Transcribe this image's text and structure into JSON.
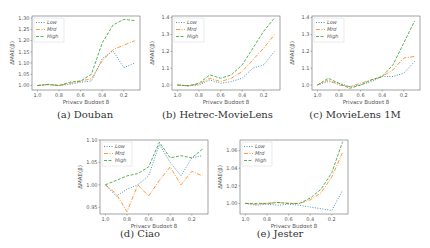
{
  "chart_data": [
    {
      "id": "a",
      "type": "line",
      "caption": "(a) Douban",
      "xlabel": "Privacy Budget β",
      "ylabel": "ΔMAE(β)",
      "x": [
        1.0,
        0.9,
        0.8,
        0.7,
        0.6,
        0.5,
        0.4,
        0.3,
        0.2,
        0.1
      ],
      "xticks": [
        "1.0",
        "0.8",
        "0.6",
        "0.4",
        "0.2"
      ],
      "xlim": [
        1.05,
        0.05
      ],
      "yticks": [
        "1.00",
        "1.05",
        "1.10",
        "1.15",
        "1.20",
        "1.25",
        "1.30"
      ],
      "ylim": [
        0.98,
        1.31
      ],
      "grid": false,
      "legend_position": "upper left",
      "series": [
        {
          "name": "Low",
          "style": "dotted",
          "values": [
            1.0,
            1.003,
            1.0,
            1.005,
            1.015,
            1.02,
            1.12,
            1.155,
            1.08,
            1.1
          ]
        },
        {
          "name": "Mrd",
          "style": "dashdot",
          "values": [
            1.0,
            1.005,
            1.0,
            1.01,
            1.02,
            1.03,
            1.11,
            1.16,
            1.18,
            1.2
          ]
        },
        {
          "name": "High",
          "style": "dashed",
          "values": [
            1.0,
            1.005,
            1.0,
            1.015,
            1.02,
            1.05,
            1.19,
            1.27,
            1.295,
            1.29
          ]
        }
      ]
    },
    {
      "id": "b",
      "type": "line",
      "caption": "(b) Hetrec-MovieLens",
      "xlabel": "Privacy Budget β",
      "ylabel": "ΔMAE(β)",
      "x": [
        1.0,
        0.9,
        0.8,
        0.7,
        0.6,
        0.5,
        0.4,
        0.3,
        0.2,
        0.1
      ],
      "xticks": [
        "1.0",
        "0.8",
        "0.6",
        "0.4",
        "0.2"
      ],
      "xlim": [
        1.05,
        0.05
      ],
      "yticks": [
        "1.0",
        "1.1",
        "1.2",
        "1.3",
        "1.4"
      ],
      "ylim": [
        0.97,
        1.41
      ],
      "grid": false,
      "legend_position": "upper left",
      "series": [
        {
          "name": "Low",
          "style": "dotted",
          "values": [
            1.0,
            0.995,
            1.0,
            1.03,
            1.01,
            1.02,
            1.04,
            1.1,
            1.12,
            1.2
          ]
        },
        {
          "name": "Mrd",
          "style": "dashdot",
          "values": [
            1.0,
            0.995,
            1.005,
            1.04,
            1.02,
            1.04,
            1.08,
            1.15,
            1.22,
            1.3
          ]
        },
        {
          "name": "High",
          "style": "dashed",
          "values": [
            1.0,
            0.995,
            1.01,
            1.06,
            1.04,
            1.06,
            1.12,
            1.22,
            1.32,
            1.4
          ]
        }
      ]
    },
    {
      "id": "c",
      "type": "line",
      "caption": "(c) MovieLens 1M",
      "xlabel": "Privacy Budget β",
      "ylabel": "ΔMAE(β)",
      "x": [
        1.0,
        0.9,
        0.8,
        0.7,
        0.6,
        0.5,
        0.4,
        0.3,
        0.2,
        0.1
      ],
      "xticks": [
        "1.0",
        "0.8",
        "0.6",
        "0.4",
        "0.2"
      ],
      "xlim": [
        1.05,
        0.05
      ],
      "yticks": [
        "1.0",
        "1.1",
        "1.2",
        "1.3",
        "1.4"
      ],
      "ylim": [
        0.97,
        1.41
      ],
      "grid": false,
      "legend_position": "upper left",
      "series": [
        {
          "name": "Low",
          "style": "dotted",
          "values": [
            1.0,
            1.02,
            1.01,
            0.99,
            1.0,
            1.02,
            1.05,
            1.05,
            1.07,
            1.14
          ]
        },
        {
          "name": "Mrd",
          "style": "dashdot",
          "values": [
            1.0,
            1.03,
            1.0,
            0.99,
            1.01,
            1.03,
            1.05,
            1.09,
            1.16,
            1.17
          ]
        },
        {
          "name": "High",
          "style": "dashed",
          "values": [
            1.0,
            1.04,
            1.01,
            0.98,
            1.0,
            1.03,
            1.05,
            1.12,
            1.25,
            1.38
          ]
        }
      ]
    },
    {
      "id": "d",
      "type": "line",
      "caption": "(d) Ciao",
      "xlabel": "Privacy Budget β",
      "ylabel": "ΔMAE(β)",
      "x": [
        1.0,
        0.9,
        0.8,
        0.7,
        0.6,
        0.5,
        0.4,
        0.3,
        0.2,
        0.1
      ],
      "xticks": [
        "1.0",
        "0.8",
        "0.6",
        "0.4",
        "0.2"
      ],
      "xlim": [
        1.05,
        0.05
      ],
      "yticks": [
        "0.95",
        "1.00",
        "1.05",
        "1.10"
      ],
      "ylim": [
        0.935,
        1.1
      ],
      "grid": false,
      "legend_position": "upper left",
      "series": [
        {
          "name": "Low",
          "style": "dotted",
          "values": [
            1.0,
            0.975,
            0.99,
            1.0,
            1.02,
            1.09,
            1.05,
            1.02,
            1.06,
            1.065
          ]
        },
        {
          "name": "Mrd",
          "style": "dashdot",
          "values": [
            1.0,
            0.98,
            0.94,
            1.0,
            0.975,
            1.01,
            1.04,
            1.0,
            1.03,
            1.02
          ]
        },
        {
          "name": "High",
          "style": "dashed",
          "values": [
            1.0,
            1.01,
            1.02,
            1.025,
            1.04,
            1.095,
            1.06,
            1.065,
            1.06,
            1.08
          ]
        }
      ]
    },
    {
      "id": "e",
      "type": "line",
      "caption": "(e) Jester",
      "xlabel": "Privacy Budget β",
      "ylabel": "ΔMAE(β)",
      "x": [
        1.0,
        0.9,
        0.8,
        0.7,
        0.6,
        0.5,
        0.4,
        0.3,
        0.2,
        0.1
      ],
      "xticks": [
        "1.0",
        "0.8",
        "0.6",
        "0.4",
        "0.2"
      ],
      "xlim": [
        1.05,
        0.05
      ],
      "yticks": [
        "1.00",
        "1.02",
        "1.04",
        "1.06"
      ],
      "ylim": [
        0.988,
        1.072
      ],
      "grid": false,
      "legend_position": "upper left",
      "series": [
        {
          "name": "Low",
          "style": "dotted",
          "values": [
            1.0,
            0.998,
            0.999,
            0.998,
            0.999,
            0.998,
            0.996,
            0.994,
            0.992,
            1.015
          ]
        },
        {
          "name": "Mrd",
          "style": "dashdot",
          "values": [
            1.0,
            0.999,
            1.0,
            1.001,
            1.0,
            1.0,
            1.004,
            1.012,
            1.03,
            1.058
          ]
        },
        {
          "name": "High",
          "style": "dashed",
          "values": [
            1.0,
            1.0,
            1.0,
            1.001,
            1.0,
            1.0,
            1.006,
            1.016,
            1.035,
            1.07
          ]
        }
      ]
    }
  ],
  "colors": {
    "Low": "#1f77b4",
    "Mrd": "#ff7f0e",
    "High": "#2ca02c"
  },
  "panels": [
    {
      "caption": "(a) Douban"
    },
    {
      "caption": "(b) Hetrec-MovieLens"
    },
    {
      "caption": "(c) MovieLens 1M"
    },
    {
      "caption": "(d) Ciao"
    },
    {
      "caption": "(e) Jester"
    }
  ]
}
